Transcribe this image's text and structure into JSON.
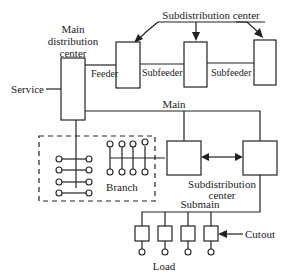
{
  "diagram": {
    "type": "electrical distribution system",
    "labels": {
      "main_distribution_center": [
        "Main",
        "distribution",
        "center"
      ],
      "subdistribution_center_top": "Subdistribution center",
      "service": "Service",
      "feeder": "Feeder",
      "subfeeder_1": "Subfeeder",
      "subfeeder_2": "Subfeeder",
      "main": "Main",
      "branch": "Branch",
      "subdistribution_center_bottom": [
        "Subdistribution",
        "center"
      ],
      "submain": "Submain",
      "cutout": "Cutout",
      "load": "Load"
    },
    "colors": {
      "line": "#222222",
      "background": "#ffffff"
    }
  }
}
